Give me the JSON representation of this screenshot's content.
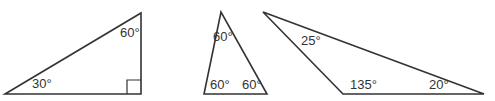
{
  "diagram": {
    "stroke_color": "#333333",
    "triangles": [
      {
        "name": "right-triangle",
        "angles": [
          "30°",
          "60°",
          "90°"
        ],
        "labels": {
          "bottom_left": "30°",
          "top_right": "60°"
        },
        "right_angle_marker": true
      },
      {
        "name": "equilateral-triangle",
        "angles": [
          "60°",
          "60°",
          "60°"
        ],
        "labels": {
          "top": "60°",
          "bottom_left": "60°",
          "bottom_right": "60°"
        }
      },
      {
        "name": "obtuse-triangle",
        "angles": [
          "25°",
          "135°",
          "20°"
        ],
        "labels": {
          "top_left": "25°",
          "bottom_middle": "135°",
          "bottom_right": "20°"
        }
      }
    ]
  }
}
